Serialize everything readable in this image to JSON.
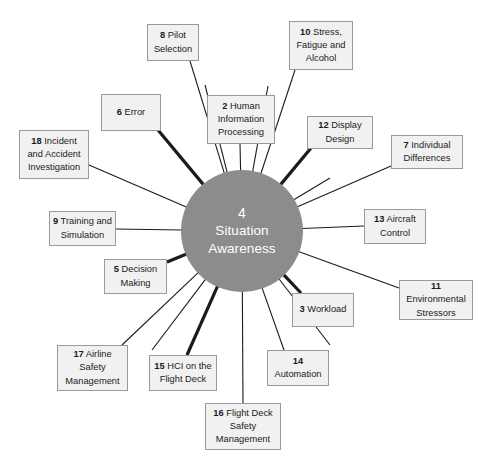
{
  "diagram": {
    "type": "hub-and-spoke",
    "background_color": "#ffffff",
    "hub": {
      "number": "4",
      "label": "Situation Awareness",
      "fill_color": "#8c8c8c",
      "text_color": "#ffffff",
      "center_x": 242,
      "center_y": 231,
      "radius": 61
    },
    "node_style": {
      "fill_color": "#f1f1f1",
      "border_color": "#9a9a9a",
      "text_color": "#1b1b1b"
    },
    "spoke_style": {
      "color": "#1b1b1b",
      "thin_width": 1.1,
      "thick_width": 3.2
    },
    "nodes": [
      {
        "number": "8",
        "label": "Pilot Selection",
        "name": "node-pilot-selection",
        "x": 147,
        "y": 24,
        "w": 52,
        "h": 37,
        "anchor_x": 190,
        "anchor_y": 61,
        "thick": false
      },
      {
        "number": "10",
        "label": "Stress, Fatigue and Alcohol",
        "name": "node-stress-fatigue-alcohol",
        "x": 289,
        "y": 21,
        "w": 64,
        "h": 49,
        "anchor_x": 295,
        "anchor_y": 70,
        "thick": false
      },
      {
        "number": "6",
        "label": "Error",
        "name": "node-error",
        "x": 101,
        "y": 94,
        "w": 60,
        "h": 37,
        "anchor_x": 158,
        "anchor_y": 130,
        "thick": true
      },
      {
        "number": "2",
        "label": "Human Information Processing",
        "name": "node-human-information-processing",
        "x": 207,
        "y": 95,
        "w": 68,
        "h": 49,
        "anchor_x": 240,
        "anchor_y": 144,
        "thick": false
      },
      {
        "number": "12",
        "label": "Display Design",
        "name": "node-display-design",
        "x": 307,
        "y": 116,
        "w": 66,
        "h": 33,
        "anchor_x": 311,
        "anchor_y": 148,
        "thick": true
      },
      {
        "number": "18",
        "label": "Incident and Accident Investigation",
        "name": "node-incident-accident-investigation",
        "x": 19,
        "y": 130,
        "w": 70,
        "h": 49,
        "anchor_x": 89,
        "anchor_y": 165,
        "thick": false
      },
      {
        "number": "7",
        "label": "Individual Differences",
        "name": "node-individual-differences",
        "x": 391,
        "y": 135,
        "w": 72,
        "h": 34,
        "anchor_x": 391,
        "anchor_y": 166,
        "thick": false
      },
      {
        "number": "9",
        "label": "Training and Simulation",
        "name": "node-training-and-simulation",
        "x": 49,
        "y": 211,
        "w": 67,
        "h": 35,
        "anchor_x": 116,
        "anchor_y": 229,
        "thick": false
      },
      {
        "number": "13",
        "label": "Aircraft Control",
        "name": "node-aircraft-control",
        "x": 364,
        "y": 209,
        "w": 62,
        "h": 35,
        "anchor_x": 364,
        "anchor_y": 226,
        "thick": false
      },
      {
        "number": "5",
        "label": "Decision Making",
        "name": "node-decision-making",
        "x": 104,
        "y": 259,
        "w": 63,
        "h": 35,
        "anchor_x": 167,
        "anchor_y": 262,
        "thick": true
      },
      {
        "number": "11",
        "label": "Environmental Stressors",
        "name": "node-environmental-stressors",
        "x": 399,
        "y": 280,
        "w": 74,
        "h": 40,
        "anchor_x": 399,
        "anchor_y": 288,
        "thick": false
      },
      {
        "number": "3",
        "label": "Workload",
        "name": "node-workload",
        "x": 292,
        "y": 293,
        "w": 62,
        "h": 34,
        "anchor_x": 301,
        "anchor_y": 293,
        "thick": true
      },
      {
        "number": "17",
        "label": "Airline Safety Management",
        "name": "node-airline-safety-management",
        "x": 57,
        "y": 345,
        "w": 71,
        "h": 46,
        "anchor_x": 122,
        "anchor_y": 345,
        "thick": false
      },
      {
        "number": "15",
        "label": "HCI on the Flight Deck",
        "name": "node-hci-on-the-flight-deck",
        "x": 149,
        "y": 355,
        "w": 68,
        "h": 36,
        "anchor_x": 187,
        "anchor_y": 355,
        "thick": true
      },
      {
        "number": "14",
        "label": "Automation",
        "name": "node-automation",
        "x": 267,
        "y": 350,
        "w": 62,
        "h": 36,
        "anchor_x": 284,
        "anchor_y": 350,
        "thick": false
      },
      {
        "number": "16",
        "label": "Flight Deck Safety Management",
        "name": "node-flight-deck-safety-management",
        "x": 205,
        "y": 403,
        "w": 76,
        "h": 47,
        "anchor_x": 243,
        "anchor_y": 403,
        "thick": false
      }
    ],
    "extra_spokes": [
      {
        "name": "spoke-stub-upper-left",
        "x": 205,
        "y": 85,
        "thick": false
      },
      {
        "name": "spoke-stub-upper-right",
        "x": 268,
        "y": 86,
        "thick": false
      },
      {
        "name": "spoke-stub-right-upper",
        "x": 330,
        "y": 178,
        "thick": false
      },
      {
        "name": "spoke-stub-lower-left",
        "x": 152,
        "y": 350,
        "thick": false
      },
      {
        "name": "spoke-stub-lower-right",
        "x": 330,
        "y": 345,
        "thick": false
      }
    ]
  }
}
